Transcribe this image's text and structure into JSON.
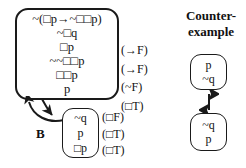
{
  "diagram": {
    "colors": {
      "stroke": "#1a1a1a",
      "text": "#111111",
      "background": "#ffffff"
    }
  },
  "main_box": {
    "name": "main-tableau-box",
    "lines": [
      "~(□p→~□□p)",
      "~□q",
      "□p",
      "~~□□p",
      "□□p",
      "p"
    ],
    "rules": [
      "(→F)",
      "(→F)",
      "(~F)",
      "(□T)"
    ]
  },
  "lower_box": {
    "name": "accessible-world-box",
    "lines": [
      "~q",
      "p",
      "□p"
    ],
    "rules": [
      "(□F)",
      "(□T)",
      "(□T)"
    ]
  },
  "relation_label": "B",
  "counterexample": {
    "title_lines": [
      "Counter-",
      "example"
    ],
    "top_world": [
      "p",
      "~q"
    ],
    "bottom_world": [
      "~q",
      "p"
    ],
    "arrow": "double-headed-vertical-arrow"
  }
}
